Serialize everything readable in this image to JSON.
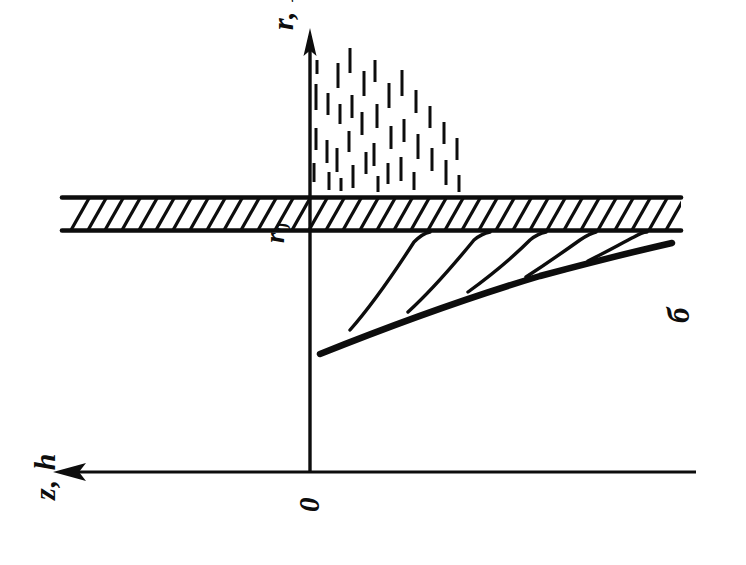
{
  "figure": {
    "type": "scientific-line-diagram",
    "background_color": "#ffffff",
    "ink_color": "#0d0d0d",
    "width": 746,
    "height": 565,
    "part_label": "б"
  },
  "labels": {
    "vertical_axis": "r, R",
    "radius_marker": "r",
    "radius_marker_sub": "0",
    "horizontal_axis": "z, h",
    "origin": "0",
    "part": "б"
  },
  "axes": {
    "vertical": {
      "name": "r, R",
      "x": 310,
      "y_top": 30,
      "y_bottom": 472,
      "arrow_at": "top",
      "stroke_width": 3.4
    },
    "horizontal": {
      "name": "z, h",
      "y": 472,
      "x_left": 55,
      "x_right": 696,
      "arrow_at": "left",
      "stroke_width": 3.2
    }
  },
  "plate": {
    "name": "hatched-plate",
    "x_left": 62,
    "x_right": 681,
    "y_top": 196,
    "y_bottom": 232,
    "hatch_angle_deg": 60,
    "hatch_spacing": 17,
    "border_stroke_width": 4.5,
    "hatch_stroke_width": 3.2
  },
  "spray": {
    "name": "spray-dashes",
    "note": "vertical tick dashes above the plate, densest near the axis, decaying to the right",
    "dash_stroke_width": 3.0,
    "dashes": [
      {
        "x": 316,
        "y1": 84,
        "y2": 110
      },
      {
        "x": 316,
        "y1": 128,
        "y2": 150
      },
      {
        "x": 314,
        "y1": 163,
        "y2": 182
      },
      {
        "x": 317,
        "y1": 60,
        "y2": 74
      },
      {
        "x": 328,
        "y1": 93,
        "y2": 115
      },
      {
        "x": 327,
        "y1": 140,
        "y2": 163
      },
      {
        "x": 329,
        "y1": 172,
        "y2": 190
      },
      {
        "x": 338,
        "y1": 63,
        "y2": 88
      },
      {
        "x": 340,
        "y1": 104,
        "y2": 124
      },
      {
        "x": 337,
        "y1": 148,
        "y2": 172
      },
      {
        "x": 341,
        "y1": 178,
        "y2": 191
      },
      {
        "x": 350,
        "y1": 48,
        "y2": 73
      },
      {
        "x": 352,
        "y1": 95,
        "y2": 118
      },
      {
        "x": 349,
        "y1": 131,
        "y2": 152
      },
      {
        "x": 353,
        "y1": 165,
        "y2": 188
      },
      {
        "x": 364,
        "y1": 71,
        "y2": 96
      },
      {
        "x": 362,
        "y1": 112,
        "y2": 135
      },
      {
        "x": 366,
        "y1": 152,
        "y2": 174
      },
      {
        "x": 375,
        "y1": 60,
        "y2": 82
      },
      {
        "x": 377,
        "y1": 104,
        "y2": 128
      },
      {
        "x": 374,
        "y1": 143,
        "y2": 166
      },
      {
        "x": 378,
        "y1": 176,
        "y2": 192
      },
      {
        "x": 389,
        "y1": 83,
        "y2": 108
      },
      {
        "x": 391,
        "y1": 126,
        "y2": 149
      },
      {
        "x": 388,
        "y1": 163,
        "y2": 184
      },
      {
        "x": 402,
        "y1": 70,
        "y2": 96
      },
      {
        "x": 404,
        "y1": 119,
        "y2": 142
      },
      {
        "x": 401,
        "y1": 157,
        "y2": 181
      },
      {
        "x": 416,
        "y1": 90,
        "y2": 113
      },
      {
        "x": 418,
        "y1": 134,
        "y2": 159
      },
      {
        "x": 414,
        "y1": 172,
        "y2": 190
      },
      {
        "x": 430,
        "y1": 106,
        "y2": 128
      },
      {
        "x": 432,
        "y1": 148,
        "y2": 171
      },
      {
        "x": 444,
        "y1": 122,
        "y2": 144
      },
      {
        "x": 446,
        "y1": 160,
        "y2": 185
      },
      {
        "x": 457,
        "y1": 138,
        "y2": 160
      },
      {
        "x": 459,
        "y1": 175,
        "y2": 192
      }
    ]
  },
  "curves": {
    "envelope": {
      "name": "main-envelope-curve",
      "stroke_width": 6.5,
      "path": "M 320 354 C 380 330, 460 300, 540 276 C 600 260, 650 248, 672 243"
    },
    "streamlines": [
      {
        "name": "streamline-1",
        "path": "M 350 330 C 372 305, 396 270, 414 242 C 420 236, 425 233, 430 232",
        "stroke_width": 3.4
      },
      {
        "name": "streamline-2",
        "path": "M 408 312 C 430 292, 456 262, 474 240 C 480 235, 485 233, 490 232",
        "stroke_width": 3.4
      },
      {
        "name": "streamline-3",
        "path": "M 468 292 C 490 276, 514 256, 530 240 C 536 235, 541 233, 546 232",
        "stroke_width": 3.4
      },
      {
        "name": "streamline-4",
        "path": "M 526 277 C 546 264, 566 250, 580 240 C 586 236, 591 233, 596 232",
        "stroke_width": 3.4
      },
      {
        "name": "streamline-5",
        "path": "M 588 261 C 606 252, 624 242, 634 237 C 639 234, 643 232, 647 232",
        "stroke_width": 3.4
      }
    ]
  }
}
